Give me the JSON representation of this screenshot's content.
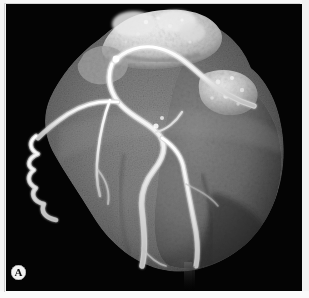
{
  "figure": {
    "panel_label": "A",
    "modality_name": "volume-rendered-cardiac-ct-angiogram",
    "background_color": "#040404",
    "page_color": "#ffffff"
  },
  "palette": {
    "background_black": "#040404",
    "myocardium_dark": "#3a3a3a",
    "myocardium_mid": "#6f6f6f",
    "myocardium_light": "#8f8f8f",
    "great_vessel_bright": "#e2e2e2",
    "great_vessel_peak": "#f1f1f1",
    "coronary_artery": "#ececec",
    "coronary_core": "#fbfbfb",
    "calcification": "#ffffff",
    "badge_fill": "#f2f2f2",
    "badge_text": "#111111"
  },
  "anatomy": {
    "structures": [
      {
        "name": "great-vessels-mass",
        "label": "great vessels / pulmonary trunk",
        "brightness": "very-bright"
      },
      {
        "name": "right-atrial-appendage",
        "label": "right atrial appendage",
        "brightness": "bright"
      },
      {
        "name": "left-ventricular-myocardium",
        "label": "left ventricular myocardium",
        "brightness": "mid-gray"
      },
      {
        "name": "cardiac-apex",
        "label": "cardiac apex",
        "brightness": "mid-gray"
      }
    ],
    "vessels": [
      {
        "name": "left-anterior-descending-artery",
        "label": "LAD",
        "course": "top-center to apex"
      },
      {
        "name": "diagonal-branch",
        "label": "diagonal branch",
        "course": "mid-left oblique"
      },
      {
        "name": "right-coronary-artery",
        "label": "RCA",
        "course": "upper right, along AV groove"
      },
      {
        "name": "posterior-descending-branch",
        "label": "posterior descending",
        "course": "center to lower right"
      },
      {
        "name": "marginal-serpentine-vessel",
        "label": "marginal branch",
        "course": "serpentine left cardiac border"
      }
    ],
    "findings": [
      {
        "name": "calcified-plaque-spot",
        "label": "focal calcification",
        "location": "proximal bifurcation"
      }
    ]
  },
  "artifacts": [
    {
      "name": "vertical-streak-artifact",
      "label": "streak artifact below apex"
    }
  ]
}
